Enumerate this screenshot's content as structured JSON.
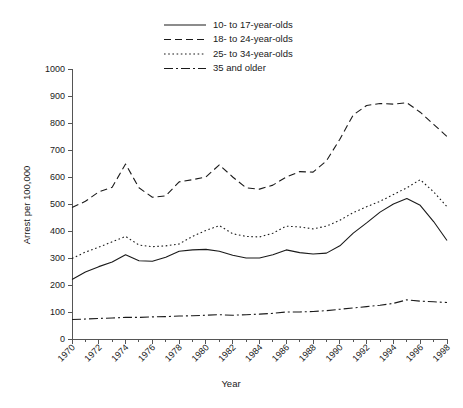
{
  "chart_data": {
    "type": "line",
    "title": "",
    "xlabel": "Year",
    "ylabel": "Arrest per 100,000",
    "xlim": [
      1970,
      1998
    ],
    "ylim": [
      0,
      1000
    ],
    "y_ticks": [
      0,
      100,
      200,
      300,
      400,
      500,
      600,
      700,
      800,
      900,
      1000
    ],
    "x_ticks": [
      1970,
      1972,
      1974,
      1976,
      1978,
      1980,
      1982,
      1984,
      1986,
      1988,
      1990,
      1992,
      1994,
      1996,
      1998
    ],
    "x_minor_ticks": [
      1971,
      1973,
      1975,
      1977,
      1979,
      1981,
      1983,
      1985,
      1987,
      1989,
      1991,
      1993,
      1995,
      1997
    ],
    "grid": false,
    "legend_position": "top-center",
    "x": [
      1970,
      1971,
      1972,
      1973,
      1974,
      1975,
      1976,
      1977,
      1978,
      1979,
      1980,
      1981,
      1982,
      1983,
      1984,
      1985,
      1986,
      1987,
      1988,
      1989,
      1990,
      1991,
      1992,
      1993,
      1994,
      1995,
      1996,
      1997,
      1998
    ],
    "series": [
      {
        "name": "10- to 17-year-olds",
        "style": "solid",
        "dash": "none",
        "color": "#1a1a1a",
        "values": [
          220,
          248,
          268,
          285,
          312,
          290,
          288,
          303,
          325,
          330,
          332,
          325,
          310,
          300,
          300,
          312,
          330,
          320,
          315,
          318,
          345,
          392,
          430,
          470,
          500,
          520,
          495,
          435,
          365
        ]
      },
      {
        "name": "18- to 24-year-olds",
        "style": "dashed",
        "dash": "7,4",
        "color": "#1a1a1a",
        "values": [
          487,
          510,
          545,
          562,
          648,
          560,
          525,
          530,
          582,
          590,
          600,
          645,
          600,
          560,
          555,
          570,
          600,
          620,
          618,
          660,
          740,
          830,
          865,
          872,
          870,
          875,
          840,
          795,
          750
        ]
      },
      {
        "name": "25- to 34-year-olds",
        "style": "dotted",
        "dash": "1.6,2.6",
        "color": "#1a1a1a",
        "values": [
          298,
          322,
          340,
          360,
          380,
          348,
          342,
          345,
          352,
          380,
          402,
          420,
          390,
          380,
          378,
          392,
          418,
          415,
          408,
          418,
          440,
          468,
          490,
          510,
          535,
          560,
          590,
          545,
          490
        ]
      },
      {
        "name": "35 and older",
        "style": "dash-dot",
        "dash": "9,3,2,3",
        "color": "#1a1a1a",
        "values": [
          72,
          74,
          76,
          78,
          80,
          80,
          82,
          83,
          85,
          86,
          88,
          90,
          88,
          90,
          92,
          95,
          100,
          100,
          102,
          105,
          110,
          115,
          120,
          125,
          132,
          145,
          140,
          138,
          135
        ]
      }
    ],
    "legend_entries": [
      "10- to 17-year-olds",
      "18- to 24-year-olds",
      "25- to 34-year-olds",
      "35 and older"
    ]
  }
}
